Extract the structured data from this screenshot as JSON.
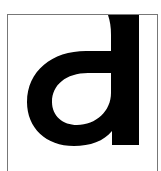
{
  "glyph": {
    "character": "a",
    "fill": "#000000",
    "frame_color": "#777777"
  }
}
